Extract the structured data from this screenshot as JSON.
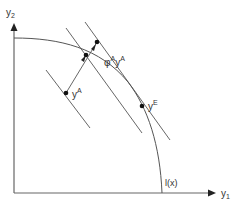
{
  "diagram": {
    "axes": {
      "y_label_main": "y",
      "y_label_sub": "2",
      "x_label_main": "y",
      "x_label_sub": "1"
    },
    "labels": {
      "point_a_main": "y",
      "point_a_sup": "A",
      "scaled_phi": "φ",
      "scaled_phi_sup": "A",
      "scaled_y": "y",
      "scaled_y_sup": "A",
      "point_e_main": "y",
      "point_e_sup": "E",
      "frontier": "l(x)"
    },
    "colors": {
      "line": "#555555",
      "axis": "#666666",
      "point": "#111111"
    }
  }
}
